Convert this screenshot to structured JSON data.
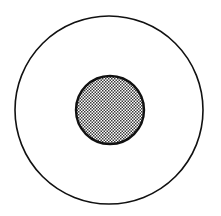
{
  "diagram": {
    "type": "concentric-circles",
    "outer_circle": {
      "cx": 109,
      "cy": 110,
      "r": 94,
      "fill": "#ffffff",
      "stroke": "#111111",
      "stroke_width": 1.6
    },
    "inner_circle": {
      "cx": 110,
      "cy": 110,
      "r": 34,
      "fill_pattern": "checker-dots",
      "stroke": "#111111",
      "stroke_width": 2.4
    },
    "pattern_colors": {
      "dark": "#3a3a3a",
      "light": "#ffffff"
    }
  }
}
